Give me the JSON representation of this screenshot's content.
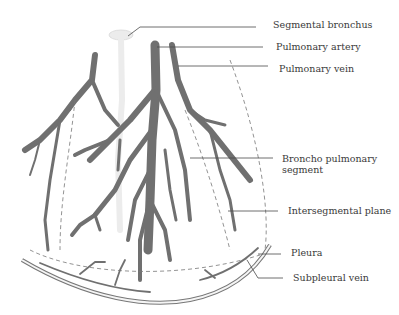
{
  "diagram": {
    "labels": {
      "segmental_bronchus": "Segmental bronchus",
      "pulmonary_artery": "Pulmonary artery",
      "pulmonary_vein": "Pulmonary vein",
      "broncho_pulmonary_segment_line1": "Broncho pulmonary",
      "broncho_pulmonary_segment_line2": "segment",
      "intersegmental_plane": "Intersegmental plane",
      "pleura": "Pleura",
      "subpleural_vein": "Subpleural vein"
    },
    "colors": {
      "vessel": "#707070",
      "leader_line": "#4a4a4a",
      "text": "#3a3a3a",
      "background": "#ffffff"
    }
  }
}
